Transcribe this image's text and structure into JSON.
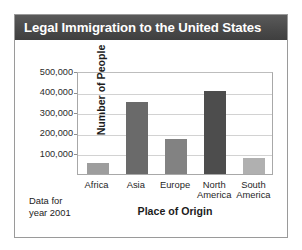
{
  "card": {
    "title": "Legal Immigration to the United States",
    "footnote_line1": "Data for",
    "footnote_line2": "year 2001"
  },
  "colors": {
    "title_bar": "#4a4a4a",
    "title_text": "#ffffff",
    "card_border": "#9a9a9a",
    "gridline": "#d2d2d2",
    "axis": "#a8a8a8"
  },
  "chart_data": {
    "type": "bar",
    "title": "Legal Immigration to the United States",
    "xlabel": "Place of Origin",
    "ylabel": "Number of People",
    "categories": [
      "Africa",
      "Asia",
      "Europe",
      "North America",
      "South America"
    ],
    "category_lines": [
      [
        "Africa"
      ],
      [
        "Asia"
      ],
      [
        "Europe"
      ],
      [
        "North",
        "America"
      ],
      [
        "South",
        "America"
      ]
    ],
    "values": [
      55000,
      350000,
      170000,
      405000,
      80000
    ],
    "bar_colors": [
      "#9d9d9d",
      "#6a6a6a",
      "#828282",
      "#4d4d4d",
      "#b0b0b0"
    ],
    "ylim": [
      0,
      500000
    ],
    "yticks": [
      100000,
      200000,
      300000,
      400000,
      500000
    ],
    "ytick_labels": [
      "100,000",
      "200,000",
      "300,000",
      "400,000",
      "500,000"
    ],
    "grid": true,
    "legend": false,
    "annotation": "Data for year 2001"
  }
}
